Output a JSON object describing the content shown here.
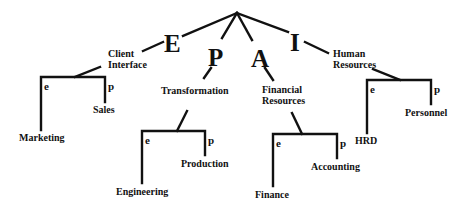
{
  "diagram": {
    "type": "tree",
    "root_letters": [
      "E",
      "P",
      "A",
      "I"
    ],
    "branches": [
      {
        "letter": "E",
        "label_lines": [
          "Client",
          "Interface"
        ],
        "e_marker": "e",
        "p_marker": "p",
        "e_child": "Marketing",
        "p_child": "Sales"
      },
      {
        "letter": "P",
        "label_lines": [
          "Transformation"
        ],
        "e_marker": "e",
        "p_marker": "p",
        "e_child": "Engineering",
        "p_child": "Production"
      },
      {
        "letter": "A",
        "label_lines": [
          "Financial",
          "Resources"
        ],
        "e_marker": "e",
        "p_marker": "p",
        "e_child": "Finance",
        "p_child": "Accounting"
      },
      {
        "letter": "I",
        "label_lines": [
          "Human",
          "Resources"
        ],
        "e_marker": "e",
        "p_marker": "p",
        "e_child": "HRD",
        "p_child": "Personnel"
      }
    ],
    "colors": {
      "line": "#111111",
      "background": "#ffffff"
    }
  }
}
